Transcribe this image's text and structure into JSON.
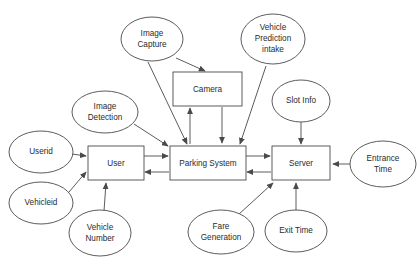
{
  "diagram": {
    "type": "er-dataflow",
    "entities": [
      {
        "id": "user",
        "label": "User",
        "shape": "rectangle"
      },
      {
        "id": "camera",
        "label": "Camera",
        "shape": "rectangle"
      },
      {
        "id": "parking_system",
        "label": "Parking System",
        "shape": "rectangle"
      },
      {
        "id": "server",
        "label": "Server",
        "shape": "rectangle"
      }
    ],
    "attributes": [
      {
        "id": "image_capture",
        "label_lines": [
          "Image",
          "Capture"
        ],
        "shape": "ellipse"
      },
      {
        "id": "vehicle_prediction_intake",
        "label_lines": [
          "Vehicle",
          "Prediction",
          "intake"
        ],
        "shape": "ellipse"
      },
      {
        "id": "image_detection",
        "label_lines": [
          "Image",
          "Detection"
        ],
        "shape": "ellipse"
      },
      {
        "id": "slot_info",
        "label_lines": [
          "Slot Info"
        ],
        "shape": "ellipse"
      },
      {
        "id": "userid",
        "label_lines": [
          "Userid"
        ],
        "shape": "ellipse"
      },
      {
        "id": "vehicleid",
        "label_lines": [
          "Vehicleid"
        ],
        "shape": "ellipse"
      },
      {
        "id": "vehicle_number",
        "label_lines": [
          "Vehicle",
          "Number"
        ],
        "shape": "ellipse"
      },
      {
        "id": "fare_generation",
        "label_lines": [
          "Fare",
          "Generation"
        ],
        "shape": "ellipse"
      },
      {
        "id": "exit_time",
        "label_lines": [
          "Exit Time"
        ],
        "shape": "ellipse"
      },
      {
        "id": "entrance_time",
        "label_lines": [
          "Entrance",
          "Time"
        ],
        "shape": "ellipse"
      }
    ],
    "labels": {
      "user": "User",
      "camera": "Camera",
      "parking_system": "Parking System",
      "server": "Server",
      "image_capture_1": "Image",
      "image_capture_2": "Capture",
      "vehicle_prediction_1": "Vehicle",
      "vehicle_prediction_2": "Prediction",
      "vehicle_prediction_3": "intake",
      "image_detection_1": "Image",
      "image_detection_2": "Detection",
      "slot_info": "Slot Info",
      "userid": "Userid",
      "vehicleid": "Vehicleid",
      "vehicle_number_1": "Vehicle",
      "vehicle_number_2": "Number",
      "fare_generation_1": "Fare",
      "fare_generation_2": "Generation",
      "exit_time": "Exit Time",
      "entrance_time_1": "Entrance",
      "entrance_time_2": "Time"
    },
    "edges": [
      {
        "from": "image_capture",
        "to": "camera",
        "arrow": "single"
      },
      {
        "from": "image_capture",
        "to": "parking_system",
        "arrow": "single"
      },
      {
        "from": "vehicle_prediction_intake",
        "to": "parking_system",
        "arrow": "single"
      },
      {
        "from": "image_detection",
        "to": "parking_system",
        "arrow": "single"
      },
      {
        "from": "slot_info",
        "to": "server",
        "arrow": "single"
      },
      {
        "from": "userid",
        "to": "user",
        "arrow": "single"
      },
      {
        "from": "vehicleid",
        "to": "user",
        "arrow": "single"
      },
      {
        "from": "vehicle_number",
        "to": "user",
        "arrow": "single"
      },
      {
        "from": "fare_generation",
        "to": "server",
        "arrow": "single"
      },
      {
        "from": "exit_time",
        "to": "server",
        "arrow": "single"
      },
      {
        "from": "entrance_time",
        "to": "server",
        "arrow": "single"
      },
      {
        "from": "user",
        "to": "parking_system",
        "arrow": "double"
      },
      {
        "from": "parking_system",
        "to": "server",
        "arrow": "double"
      },
      {
        "from": "camera",
        "to": "parking_system",
        "arrow": "double"
      }
    ],
    "colors": {
      "background": "#ffffff",
      "stroke": "#4a4a4a",
      "text": "#2b2b2b"
    }
  }
}
